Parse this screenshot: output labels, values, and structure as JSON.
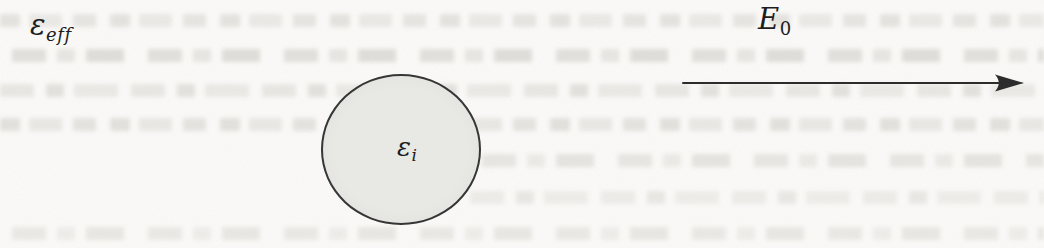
{
  "figure": {
    "labels": {
      "effective_medium": {
        "symbol": "ε",
        "subscript": "eff"
      },
      "inclusion": {
        "symbol": "ε",
        "subscript": "i"
      },
      "applied_field": {
        "symbol": "E",
        "subscript": "0"
      }
    },
    "colors": {
      "paper": "#fbfaf8",
      "sphere_fill": "#e8e8e5",
      "sphere_stroke": "#363636",
      "arrow": "#2c2c2c",
      "ink": "#1d1d1d",
      "ghost_text": "#b0b0a8"
    }
  }
}
